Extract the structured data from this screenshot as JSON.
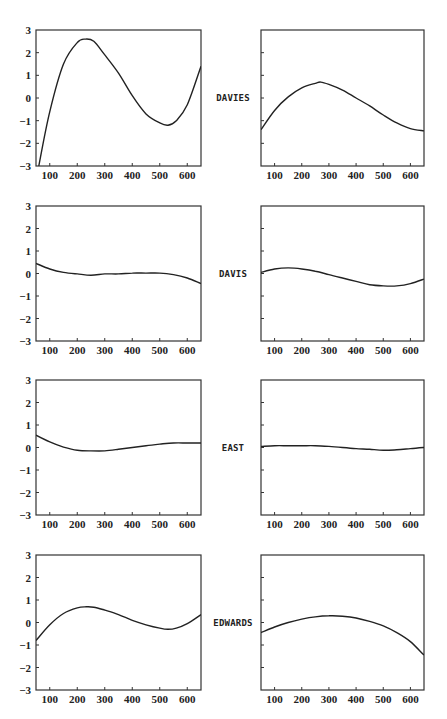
{
  "figure": {
    "x_axis": {
      "range": [
        50,
        650
      ],
      "ticks": [
        100,
        200,
        300,
        400,
        500,
        600
      ]
    },
    "y_axis": {
      "range": [
        -3,
        3
      ],
      "ticks": [
        -3,
        -2,
        -1,
        0,
        1,
        2,
        3
      ]
    },
    "rows": [
      {
        "label": "DAVIES"
      },
      {
        "label": "DAVIS"
      },
      {
        "label": "EAST"
      },
      {
        "label": "EDWARDS"
      }
    ]
  },
  "chart_data": [
    {
      "type": "line",
      "panel": "row1-left",
      "row_label": "DAVIES",
      "title": "",
      "xlabel": "",
      "ylabel": "",
      "xlim": [
        50,
        650
      ],
      "ylim": [
        -3,
        3
      ],
      "grid": false,
      "y_tick_labels_shown": true,
      "x": [
        60,
        100,
        150,
        200,
        230,
        260,
        300,
        350,
        400,
        450,
        500,
        530,
        560,
        600,
        650
      ],
      "series": [
        {
          "name": "DAVIES left",
          "values": [
            -3.0,
            -0.6,
            1.5,
            2.45,
            2.6,
            2.5,
            1.9,
            1.1,
            0.1,
            -0.7,
            -1.1,
            -1.2,
            -1.0,
            -0.3,
            1.4
          ]
        }
      ]
    },
    {
      "type": "line",
      "panel": "row1-right",
      "row_label": "DAVIES",
      "title": "",
      "xlabel": "",
      "ylabel": "",
      "xlim": [
        50,
        650
      ],
      "ylim": [
        -3,
        3
      ],
      "grid": false,
      "y_tick_labels_shown": false,
      "x": [
        50,
        100,
        150,
        200,
        250,
        270,
        300,
        350,
        400,
        450,
        500,
        550,
        600,
        650
      ],
      "series": [
        {
          "name": "DAVIES right",
          "values": [
            -1.4,
            -0.55,
            0.05,
            0.45,
            0.65,
            0.7,
            0.6,
            0.35,
            0.0,
            -0.35,
            -0.75,
            -1.1,
            -1.35,
            -1.45
          ]
        }
      ]
    },
    {
      "type": "line",
      "panel": "row2-left",
      "row_label": "DAVIS",
      "title": "",
      "xlabel": "",
      "ylabel": "",
      "xlim": [
        50,
        650
      ],
      "ylim": [
        -3,
        3
      ],
      "grid": false,
      "y_tick_labels_shown": true,
      "x": [
        50,
        100,
        150,
        200,
        250,
        300,
        350,
        400,
        450,
        500,
        550,
        600,
        650
      ],
      "series": [
        {
          "name": "DAVIS left",
          "values": [
            0.45,
            0.2,
            0.05,
            -0.02,
            -0.08,
            -0.02,
            -0.02,
            0.02,
            0.02,
            0.02,
            -0.05,
            -0.2,
            -0.45
          ]
        }
      ]
    },
    {
      "type": "line",
      "panel": "row2-right",
      "row_label": "DAVIS",
      "title": "",
      "xlabel": "",
      "ylabel": "",
      "xlim": [
        50,
        650
      ],
      "ylim": [
        -3,
        3
      ],
      "grid": false,
      "y_tick_labels_shown": false,
      "x": [
        50,
        100,
        150,
        200,
        250,
        300,
        350,
        400,
        450,
        500,
        550,
        600,
        650
      ],
      "series": [
        {
          "name": "DAVIS right",
          "values": [
            0.05,
            0.2,
            0.25,
            0.2,
            0.1,
            -0.05,
            -0.2,
            -0.35,
            -0.5,
            -0.55,
            -0.55,
            -0.45,
            -0.25
          ]
        }
      ]
    },
    {
      "type": "line",
      "panel": "row3-left",
      "row_label": "EAST",
      "title": "",
      "xlabel": "",
      "ylabel": "",
      "xlim": [
        50,
        650
      ],
      "ylim": [
        -3,
        3
      ],
      "grid": false,
      "y_tick_labels_shown": true,
      "x": [
        50,
        100,
        150,
        200,
        250,
        300,
        350,
        400,
        450,
        500,
        550,
        600,
        650
      ],
      "series": [
        {
          "name": "EAST left",
          "values": [
            0.55,
            0.25,
            0.02,
            -0.12,
            -0.15,
            -0.15,
            -0.08,
            0.0,
            0.08,
            0.15,
            0.2,
            0.2,
            0.2
          ]
        }
      ]
    },
    {
      "type": "line",
      "panel": "row3-right",
      "row_label": "EAST",
      "title": "",
      "xlabel": "",
      "ylabel": "",
      "xlim": [
        50,
        650
      ],
      "ylim": [
        -3,
        3
      ],
      "grid": false,
      "y_tick_labels_shown": false,
      "x": [
        50,
        100,
        150,
        200,
        250,
        300,
        350,
        400,
        450,
        500,
        550,
        600,
        650
      ],
      "series": [
        {
          "name": "EAST right",
          "values": [
            0.05,
            0.08,
            0.08,
            0.08,
            0.08,
            0.05,
            0.0,
            -0.05,
            -0.08,
            -0.12,
            -0.1,
            -0.05,
            0.0
          ]
        }
      ]
    },
    {
      "type": "line",
      "panel": "row4-left",
      "row_label": "EDWARDS",
      "title": "",
      "xlabel": "",
      "ylabel": "",
      "xlim": [
        50,
        650
      ],
      "ylim": [
        -3,
        3
      ],
      "grid": false,
      "y_tick_labels_shown": true,
      "x": [
        50,
        100,
        150,
        200,
        230,
        260,
        300,
        350,
        400,
        450,
        500,
        530,
        560,
        600,
        650
      ],
      "series": [
        {
          "name": "EDWARDS left",
          "values": [
            -0.8,
            -0.1,
            0.4,
            0.65,
            0.7,
            0.68,
            0.55,
            0.35,
            0.1,
            -0.1,
            -0.25,
            -0.3,
            -0.25,
            -0.05,
            0.35
          ]
        }
      ]
    },
    {
      "type": "line",
      "panel": "row4-right",
      "row_label": "EDWARDS",
      "title": "",
      "xlabel": "",
      "ylabel": "",
      "xlim": [
        50,
        650
      ],
      "ylim": [
        -3,
        3
      ],
      "grid": false,
      "y_tick_labels_shown": false,
      "x": [
        50,
        100,
        150,
        200,
        250,
        300,
        350,
        400,
        450,
        500,
        550,
        600,
        650
      ],
      "series": [
        {
          "name": "EDWARDS right",
          "values": [
            -0.45,
            -0.2,
            0.0,
            0.15,
            0.25,
            0.3,
            0.28,
            0.2,
            0.05,
            -0.15,
            -0.45,
            -0.85,
            -1.45
          ]
        }
      ]
    }
  ]
}
